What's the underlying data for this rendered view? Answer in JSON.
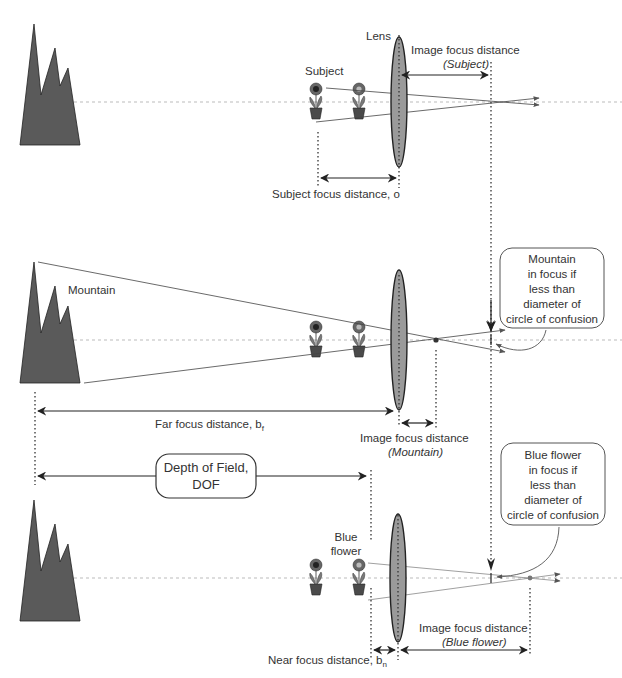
{
  "diagram": {
    "colors": {
      "mountain": "#5a5a5a",
      "lens": "#9a9a9a",
      "line": "#222222",
      "axis": "#aaaaaa",
      "text": "#333333"
    },
    "panel_top": {
      "lens_label": "Lens",
      "subject_label": "Subject",
      "image_focus_label": "Image focus distance",
      "image_focus_sub": "(Subject)",
      "subject_focus_label": "Subject focus distance, o"
    },
    "panel_middle": {
      "mountain_label": "Mountain",
      "callout_lines": [
        "Mountain",
        "in focus if",
        "less than",
        "diameter of",
        "circle of confusion"
      ],
      "far_focus_label": "Far focus distance, b",
      "far_focus_sub": "f",
      "image_focus_label": "Image focus distance",
      "image_focus_sub": "(Mountain)"
    },
    "panel_bottom": {
      "dof_lines": [
        "Depth of Field,",
        "DOF"
      ],
      "blue_flower_lines": [
        "Blue",
        "flower"
      ],
      "callout_lines": [
        "Blue flower",
        "in focus if",
        "less than",
        "diameter of",
        "circle of confusion"
      ],
      "near_focus_label": "Near focus distance, b",
      "near_focus_sub": "n",
      "image_focus_label": "Image focus distance",
      "image_focus_sub": "(Blue flower)"
    }
  }
}
